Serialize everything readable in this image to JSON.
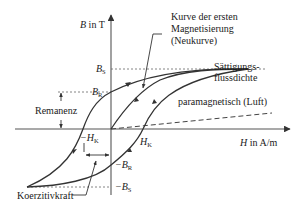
{
  "diagram": {
    "colors": {
      "line": "#333333",
      "dashed": "#555555",
      "text": "#1a1a1a",
      "background": "#ffffff"
    },
    "axes": {
      "y_label_var": "B",
      "y_label_unit": " in T",
      "x_label_var": "H",
      "x_label_unit": " in A/m"
    },
    "ticks": {
      "bs": {
        "var": "B",
        "sub": "S"
      },
      "br": {
        "var": "B",
        "sub": "R"
      },
      "neg_br": {
        "var": "−B",
        "sub": "R"
      },
      "neg_bs": {
        "var": "−B",
        "sub": "S"
      },
      "hk": {
        "var": "H",
        "sub": "K"
      },
      "neg_hk": {
        "var": "−H",
        "sub": "K"
      }
    },
    "annotations": {
      "neukurve_line1": "Kurve der ersten",
      "neukurve_line2": "Magnetisierung",
      "neukurve_line3": "(Neukurve)",
      "saettigung_line1": "Sättigungs-",
      "saettigung_line2": "flussdichte",
      "paramagnetisch": "paramagnetisch (Luft)",
      "remanenz": "Remanenz",
      "koerzitivkraft": "Koerzitivkraft"
    },
    "curves": [
      {
        "name": "upper-branch",
        "description": "descending branch from +B_S through B_R and −H_K to −B_S"
      },
      {
        "name": "lower-branch",
        "description": "ascending branch from −B_S through −B_R and +H_K to +B_S"
      },
      {
        "name": "initial-magnetization",
        "description": "Neukurve from origin to saturation"
      },
      {
        "name": "paramagnetic-line",
        "description": "dashed straight line from origin, low slope"
      }
    ]
  }
}
